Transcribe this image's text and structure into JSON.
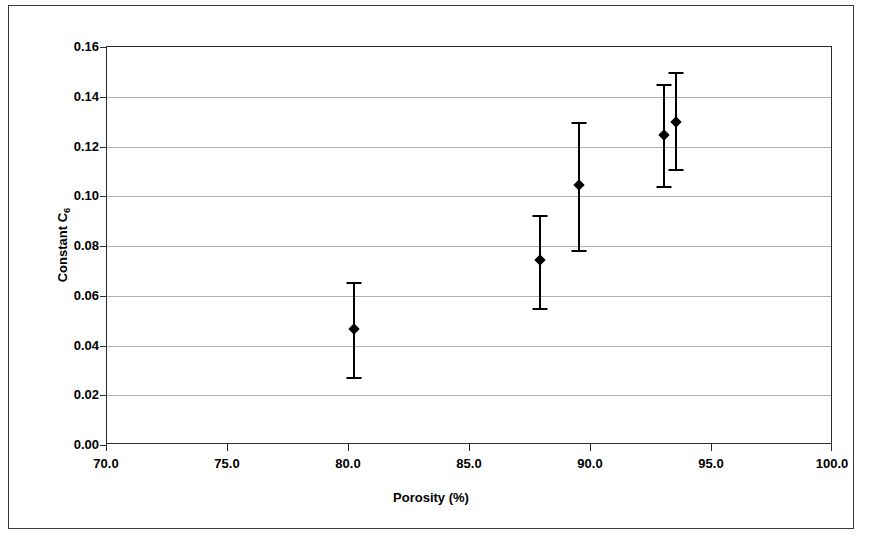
{
  "chart_data": {
    "type": "scatter",
    "title": "",
    "xlabel": "Porosity (%)",
    "ylabel": "Constant C6",
    "ylabel_base": "Constant C",
    "ylabel_sub": "6",
    "xlim": [
      70.0,
      100.0
    ],
    "ylim": [
      0.0,
      0.16
    ],
    "xticks": [
      70.0,
      75.0,
      80.0,
      85.0,
      90.0,
      95.0,
      100.0
    ],
    "xtick_labels": [
      "70.0",
      "75.0",
      "80.0",
      "85.0",
      "90.0",
      "95.0",
      "100.0"
    ],
    "yticks": [
      0.0,
      0.02,
      0.04,
      0.06,
      0.08,
      0.1,
      0.12,
      0.14,
      0.16
    ],
    "ytick_labels": [
      "0.00",
      "0.02",
      "0.04",
      "0.06",
      "0.08",
      "0.10",
      "0.12",
      "0.14",
      "0.16"
    ],
    "grid": "horizontal",
    "legend": "none",
    "marker": "filled-diamond",
    "marker_color": "#000000",
    "errorbar_color": "#000000",
    "grid_color": "#b0b0b0",
    "axis_color": "#2b2b2b",
    "background": "#ffffff",
    "x": [
      80.2,
      87.9,
      89.5,
      93.0,
      93.5
    ],
    "y": [
      0.0465,
      0.0745,
      0.1045,
      0.1245,
      0.13
    ],
    "yerr_low": [
      0.0275,
      0.055,
      0.0785,
      0.104,
      0.111
    ],
    "yerr_high": [
      0.0655,
      0.0925,
      0.13,
      0.145,
      0.15
    ],
    "points": [
      {
        "x": 80.2,
        "y": 0.0465,
        "low": 0.0275,
        "high": 0.0655
      },
      {
        "x": 87.9,
        "y": 0.0745,
        "low": 0.055,
        "high": 0.0925
      },
      {
        "x": 89.5,
        "y": 0.1045,
        "low": 0.0785,
        "high": 0.13
      },
      {
        "x": 93.0,
        "y": 0.1245,
        "low": 0.104,
        "high": 0.145
      },
      {
        "x": 93.5,
        "y": 0.13,
        "low": 0.111,
        "high": 0.15
      }
    ]
  }
}
